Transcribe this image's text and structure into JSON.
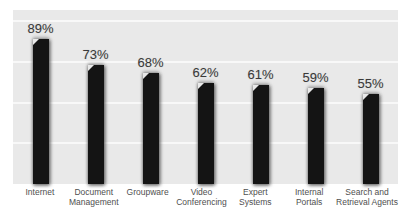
{
  "chart_data": {
    "type": "bar",
    "title": "",
    "xlabel": "",
    "ylabel": "",
    "categories": [
      "Internet",
      "Document Management",
      "Groupware",
      "Video Conferencing",
      "Expert Systems",
      "Internal Portals",
      "Search and Retrieval Agents"
    ],
    "category_lines": [
      [
        "Internet"
      ],
      [
        "Document",
        "Management"
      ],
      [
        "Groupware"
      ],
      [
        "Video",
        "Conferencing"
      ],
      [
        "Expert",
        "Systems"
      ],
      [
        "Internal",
        "Portals"
      ],
      [
        "Search and",
        "Retrieval Agents"
      ]
    ],
    "values": [
      89,
      73,
      68,
      62,
      61,
      59,
      55
    ],
    "value_labels": [
      "89%",
      "73%",
      "68%",
      "62%",
      "61%",
      "59%",
      "55%"
    ],
    "ylim": [
      0,
      107
    ],
    "gridlines_pct": [
      25,
      50,
      75,
      100
    ],
    "legend": "none",
    "colors": {
      "plot_bg": "#e9e9e9",
      "grid": "#f8f8f8",
      "bar": "#141414",
      "value_label": "#3a3a3a",
      "category_label": "#4f4f4f",
      "page_bg": "#ffffff"
    }
  }
}
